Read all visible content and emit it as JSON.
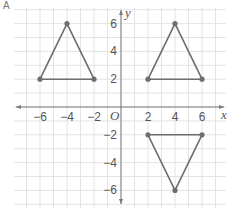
{
  "figure": {
    "corner_label": "A",
    "grid": {
      "xmin": -8,
      "xmax": 7,
      "ymin": -7,
      "ymax": 7,
      "minor_step": 1
    },
    "axes": {
      "x_label": "x",
      "y_label": "y",
      "origin_label": "O",
      "x_ticks": [
        {
          "value": -6,
          "label": "−6"
        },
        {
          "value": -4,
          "label": "−4"
        },
        {
          "value": -2,
          "label": "−2"
        },
        {
          "value": 2,
          "label": "2"
        },
        {
          "value": 4,
          "label": "4"
        },
        {
          "value": 6,
          "label": "6"
        }
      ],
      "y_ticks": [
        {
          "value": 6,
          "label": "6"
        },
        {
          "value": 4,
          "label": "4"
        },
        {
          "value": 2,
          "label": "2"
        },
        {
          "value": -2,
          "label": "−2"
        },
        {
          "value": -4,
          "label": "−4"
        },
        {
          "value": -6,
          "label": "−6"
        }
      ]
    },
    "shapes": [
      {
        "name": "triangle-quadrant-2",
        "vertices": [
          [
            -6,
            2
          ],
          [
            -4,
            6
          ],
          [
            -2,
            2
          ]
        ]
      },
      {
        "name": "triangle-quadrant-1",
        "vertices": [
          [
            2,
            2
          ],
          [
            4,
            6
          ],
          [
            6,
            2
          ]
        ]
      },
      {
        "name": "triangle-quadrant-4",
        "vertices": [
          [
            2,
            -2
          ],
          [
            6,
            -2
          ],
          [
            4,
            -6
          ]
        ]
      }
    ],
    "colors": {
      "grid": "#e4e4e4",
      "axis": "#7a7a7a",
      "shape_stroke": "#6e6e6e",
      "vertex": "#6e6e6e",
      "text": "#555555"
    }
  }
}
